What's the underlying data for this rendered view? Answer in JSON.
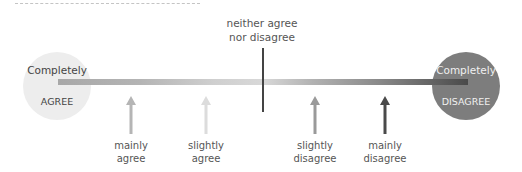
{
  "diagram": {
    "type": "likert-scale",
    "neutral": {
      "line1": "neither agree",
      "line2": "nor disagree"
    },
    "left_anchor": {
      "line1": "Completely",
      "line2": "AGREE",
      "color": "#ededed"
    },
    "right_anchor": {
      "line1": "Completely",
      "line2": "DISAGREE",
      "color": "#7d7d7d"
    },
    "scale_bar": {
      "gradient": [
        "#a8a8a8",
        "#d8d8d8",
        "#4a4a4a"
      ]
    },
    "points": [
      {
        "line1": "mainly",
        "line2": "agree",
        "x": 131,
        "color": "#b5b5b5"
      },
      {
        "line1": "slightly",
        "line2": "agree",
        "x": 206,
        "color": "#dcdcdc"
      },
      {
        "line1": "slightly",
        "line2": "disagree",
        "x": 315,
        "color": "#9a9a9a"
      },
      {
        "line1": "mainly",
        "line2": "disagree",
        "x": 385,
        "color": "#4a4a4a"
      }
    ]
  }
}
